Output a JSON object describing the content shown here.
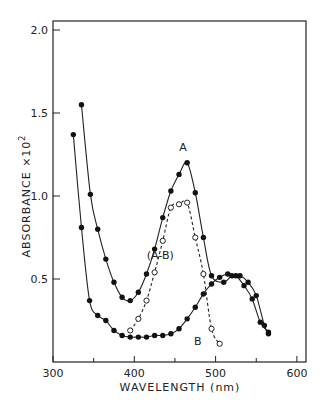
{
  "chart_data": {
    "type": "line",
    "title": "",
    "xlabel": "WAVELENGTH (nm)",
    "ylabel": "ABSORBANCE ×10²",
    "xlim": [
      300,
      610
    ],
    "ylim": [
      0,
      2.0
    ],
    "xticks": [
      300,
      400,
      500,
      600
    ],
    "xtick_labels": [
      "300",
      "400",
      "500",
      "600"
    ],
    "xminor": [
      350,
      450,
      550
    ],
    "yticks": [
      0.5,
      1.0,
      1.5,
      2.0
    ],
    "ytick_labels": [
      "0.5",
      "1.0",
      "1.5",
      "2.0"
    ],
    "grid": false,
    "series": [
      {
        "name": "A",
        "label_pos": [
          460,
          1.27
        ],
        "marker": "filled",
        "line": "solid",
        "x": [
          335,
          346,
          355,
          365,
          375,
          385,
          395,
          405,
          415,
          425,
          435,
          445,
          455,
          465,
          475,
          485,
          495,
          510,
          520,
          530,
          540,
          550,
          560,
          565
        ],
        "y": [
          1.55,
          1.01,
          0.8,
          0.62,
          0.48,
          0.39,
          0.37,
          0.42,
          0.53,
          0.68,
          0.87,
          1.03,
          1.13,
          1.2,
          1.02,
          0.75,
          0.52,
          0.48,
          0.52,
          0.52,
          0.48,
          0.4,
          0.22,
          0.17
        ]
      },
      {
        "name": "B",
        "label_pos": [
          478,
          0.1
        ],
        "marker": "filled",
        "line": "solid",
        "x": [
          325,
          335,
          345,
          355,
          365,
          375,
          385,
          395,
          405,
          415,
          425,
          435,
          445,
          455,
          465,
          475,
          485,
          495,
          505,
          515,
          525,
          535,
          545,
          555,
          565
        ],
        "y": [
          1.37,
          0.81,
          0.37,
          0.28,
          0.25,
          0.19,
          0.16,
          0.15,
          0.15,
          0.15,
          0.16,
          0.16,
          0.17,
          0.2,
          0.26,
          0.33,
          0.41,
          0.47,
          0.51,
          0.53,
          0.52,
          0.46,
          0.38,
          0.24,
          0.18
        ]
      },
      {
        "name": "(A-B)",
        "label_pos": [
          432,
          0.62
        ],
        "marker": "open",
        "line": "dashed",
        "x": [
          395,
          405,
          415,
          425,
          435,
          445,
          455,
          465,
          475,
          485,
          495,
          505
        ],
        "y": [
          0.19,
          0.26,
          0.37,
          0.54,
          0.73,
          0.93,
          0.95,
          0.96,
          0.75,
          0.53,
          0.2,
          0.11
        ]
      }
    ]
  }
}
